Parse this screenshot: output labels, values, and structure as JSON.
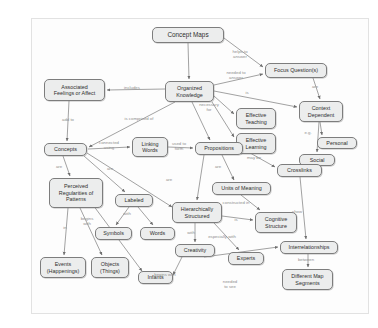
{
  "credit": "Courtesy of Joseph D. Novak and Alberto J. Cañas, http://cmap.ihmc.us",
  "diagram": {
    "title": "Concept Maps",
    "type": "concept-map",
    "style": {
      "node_fill": "#eceded",
      "node_border": "#7d7d7d",
      "edge_color": "#7a7a7a",
      "label_color": "#8e8e8e",
      "canvas_bg": "#fdfdfd"
    },
    "nodes": [
      {
        "id": "concept-maps",
        "label": "Concept Maps",
        "x": 120,
        "y": 8,
        "w": 72,
        "h": 16
      },
      {
        "id": "focus-questions",
        "label": "Focus Question(s)",
        "x": 233,
        "y": 44,
        "w": 62,
        "h": 15
      },
      {
        "id": "organized-knowledge",
        "label": "Organized\nKnowledge",
        "x": 133,
        "y": 62,
        "w": 49,
        "h": 21
      },
      {
        "id": "associated-feelings",
        "label": "Associated\nFeelings or Affect",
        "x": 12,
        "y": 60,
        "w": 61,
        "h": 22
      },
      {
        "id": "context-dependent",
        "label": "Context\nDependent",
        "x": 267,
        "y": 82,
        "w": 44,
        "h": 21
      },
      {
        "id": "effective-teaching",
        "label": "Effective\nTeaching",
        "x": 204,
        "y": 89,
        "w": 40,
        "h": 21
      },
      {
        "id": "effective-learning",
        "label": "Effective\nLearning",
        "x": 204,
        "y": 114,
        "w": 40,
        "h": 21
      },
      {
        "id": "personal",
        "label": "Personal",
        "x": 285,
        "y": 118,
        "w": 40,
        "h": 12
      },
      {
        "id": "social",
        "label": "Social",
        "x": 267,
        "y": 135,
        "w": 36,
        "h": 12
      },
      {
        "id": "concepts",
        "label": "Concepts",
        "x": 12,
        "y": 124,
        "w": 43,
        "h": 13
      },
      {
        "id": "linking-words",
        "label": "Linking\nWords",
        "x": 100,
        "y": 118,
        "w": 36,
        "h": 20
      },
      {
        "id": "propositions",
        "label": "Propositions",
        "x": 163,
        "y": 123,
        "w": 48,
        "h": 13
      },
      {
        "id": "crosslinks",
        "label": "Crosslinks",
        "x": 245,
        "y": 145,
        "w": 45,
        "h": 13
      },
      {
        "id": "units-of-meaning",
        "label": "Units of Meaning",
        "x": 180,
        "y": 163,
        "w": 59,
        "h": 13
      },
      {
        "id": "perceived-regularities",
        "label": "Perceived\nRegularities of\nPatterns",
        "x": 17,
        "y": 159,
        "w": 54,
        "h": 30
      },
      {
        "id": "labeled",
        "label": "Labeled",
        "x": 83,
        "y": 175,
        "w": 38,
        "h": 13
      },
      {
        "id": "hierarchically-structured",
        "label": "Hierarchically\nStructured",
        "x": 140,
        "y": 183,
        "w": 50,
        "h": 21
      },
      {
        "id": "cognitive-structure",
        "label": "Cognitive\nStructure",
        "x": 223,
        "y": 193,
        "w": 42,
        "h": 21
      },
      {
        "id": "symbols",
        "label": "Symbols",
        "x": 63,
        "y": 208,
        "w": 37,
        "h": 13
      },
      {
        "id": "words",
        "label": "Words",
        "x": 108,
        "y": 208,
        "w": 35,
        "h": 13
      },
      {
        "id": "interrelationships",
        "label": "Interrelationships",
        "x": 248,
        "y": 222,
        "w": 58,
        "h": 13
      },
      {
        "id": "creativity",
        "label": "Creativity",
        "x": 143,
        "y": 225,
        "w": 40,
        "h": 13
      },
      {
        "id": "experts",
        "label": "Experts",
        "x": 196,
        "y": 233,
        "w": 36,
        "h": 13
      },
      {
        "id": "events",
        "label": "Events\n(Happenings)",
        "x": 8,
        "y": 238,
        "w": 46,
        "h": 21
      },
      {
        "id": "objects",
        "label": "Objects\n(Things)",
        "x": 59,
        "y": 238,
        "w": 38,
        "h": 21
      },
      {
        "id": "infants",
        "label": "Infants",
        "x": 106,
        "y": 252,
        "w": 35,
        "h": 13
      },
      {
        "id": "different-map-segments",
        "label": "Different Map\nSegments",
        "x": 250,
        "y": 250,
        "w": 51,
        "h": 21
      }
    ],
    "edge_labels": [
      {
        "id": "helps-to-answer",
        "text": "helps to\nanswer",
        "x": 208,
        "y": 36
      },
      {
        "id": "needed-to-answer",
        "text": "needed to\nanswer",
        "x": 204,
        "y": 57
      },
      {
        "id": "includes",
        "text": "includes",
        "x": 100,
        "y": 69
      },
      {
        "id": "is",
        "text": "is",
        "x": 215,
        "y": 74
      },
      {
        "id": "are-context",
        "text": "are",
        "x": 283,
        "y": 68
      },
      {
        "id": "necessary-for",
        "text": "necessary\nfor",
        "x": 177,
        "y": 89
      },
      {
        "id": "is-comprised-of",
        "text": "is comprised of",
        "x": 107,
        "y": 100
      },
      {
        "id": "add-to",
        "text": "add to",
        "x": 36,
        "y": 101
      },
      {
        "id": "eg",
        "text": "e.g.",
        "x": 276,
        "y": 114
      },
      {
        "id": "connected-using",
        "text": "connected\nusing",
        "x": 77,
        "y": 127
      },
      {
        "id": "used-to-form",
        "text": "used to\nform",
        "x": 147,
        "y": 128
      },
      {
        "id": "may-be",
        "text": "may be",
        "x": 222,
        "y": 139
      },
      {
        "id": "are-perceived",
        "text": "are",
        "x": 27,
        "y": 148
      },
      {
        "id": "are-labeled",
        "text": "are",
        "x": 78,
        "y": 150
      },
      {
        "id": "are-propositions",
        "text": "are",
        "x": 186,
        "y": 148
      },
      {
        "id": "are-hierarchical",
        "text": "are",
        "x": 137,
        "y": 161
      },
      {
        "id": "constructed-in",
        "text": "constructed in",
        "x": 204,
        "y": 184
      },
      {
        "id": "show",
        "text": "show",
        "x": 265,
        "y": 193
      },
      {
        "id": "with-labeled",
        "text": "with",
        "x": 95,
        "y": 195
      },
      {
        "id": "is-cognitive",
        "text": "is",
        "x": 204,
        "y": 201
      },
      {
        "id": "in",
        "text": "in",
        "x": 33,
        "y": 209
      },
      {
        "id": "begins-with-objects",
        "text": "begins\nwith",
        "x": 55,
        "y": 203
      },
      {
        "id": "with-creativity",
        "text": "with",
        "x": 159,
        "y": 214
      },
      {
        "id": "especially-with",
        "text": "especially with",
        "x": 190,
        "y": 218
      },
      {
        "id": "between",
        "text": "between",
        "x": 274,
        "y": 241
      },
      {
        "id": "begins-with-infants",
        "text": "begins with",
        "x": 133,
        "y": 256
      },
      {
        "id": "needed-to-see",
        "text": "needed\nto see",
        "x": 198,
        "y": 266
      }
    ]
  }
}
